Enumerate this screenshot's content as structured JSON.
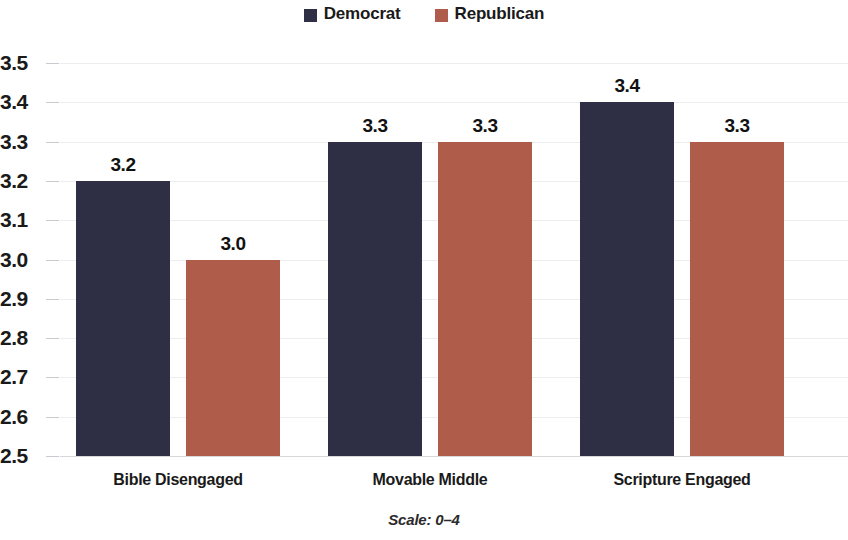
{
  "chart_data": {
    "type": "bar",
    "title": "",
    "subtitle": "",
    "xlabel": "",
    "ylabel": "",
    "categories": [
      "Bible Disengaged",
      "Movable Middle",
      "Scripture Engaged"
    ],
    "series": [
      {
        "name": "Democrat",
        "color": "#2e2e45",
        "values": [
          3.2,
          3.3,
          3.4
        ],
        "labels": [
          "3.2",
          "3.3",
          "3.4"
        ]
      },
      {
        "name": "Republican",
        "color": "#b05c4a",
        "values": [
          3.0,
          3.3,
          3.3
        ],
        "labels": [
          "3.0",
          "3.3",
          "3.3"
        ]
      }
    ],
    "ylim": [
      2.5,
      3.5
    ],
    "ytick_step": 0.1,
    "ytick_labels": [
      "3.5",
      "3.4",
      "3.3",
      "3.2",
      "3.1",
      "3.0",
      "2.9",
      "2.8",
      "2.7",
      "2.6",
      "2.5"
    ],
    "grid": true,
    "grid_axis": "y",
    "legend_position": "top-center",
    "footnote": "Scale: 0–4",
    "note": "Rightmost Republican bar is clipped by the image edge."
  },
  "legend": {
    "items": [
      {
        "label": "Democrat",
        "swatch": "legend-swatch-democrat"
      },
      {
        "label": "Republican",
        "swatch": "legend-swatch-republican"
      }
    ]
  },
  "footnote": {
    "text": "Scale: 0–4"
  }
}
